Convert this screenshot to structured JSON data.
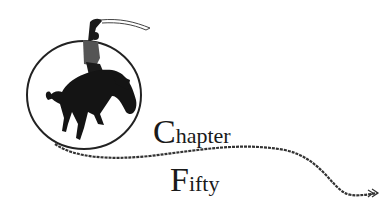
{
  "heading": {
    "line1": {
      "initial": "C",
      "rest": "hapter"
    },
    "line2": {
      "initial": "F",
      "rest": "ifty"
    }
  },
  "illustration": {
    "subject": "bucking-bronco-rider-with-lasso",
    "ink_color": "#1a1a1a",
    "background_color": "#ffffff"
  }
}
